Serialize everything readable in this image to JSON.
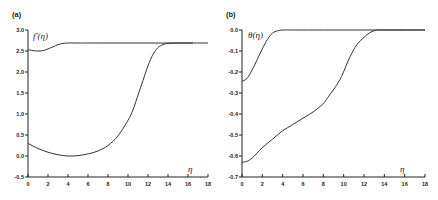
{
  "chart_data": [
    {
      "type": "line",
      "panel_label": "(a)",
      "title": "",
      "xlabel": "η",
      "ylabel": "f′(η)",
      "xlim": [
        0,
        18
      ],
      "ylim": [
        -0.5,
        3.0
      ],
      "xticks": [
        0,
        2,
        4,
        6,
        8,
        10,
        12,
        14,
        16,
        18
      ],
      "xtick_labels": [
        "0",
        "2",
        "4",
        "6",
        "8",
        "10",
        "12",
        "14",
        "16",
        "18"
      ],
      "yticks": [
        3.0,
        2.5,
        2.0,
        1.5,
        1.0,
        0.5,
        0.0,
        -0.5
      ],
      "ytick_labels": [
        "3.0",
        "2.5",
        "2.0",
        "1.5",
        "1.0",
        "0.5",
        "0.0",
        "-0.5"
      ],
      "grid": false,
      "legend": null,
      "series": [
        {
          "name": "upper solution",
          "x": [
            0,
            0.5,
            1,
            1.5,
            2,
            2.5,
            3,
            3.5,
            4,
            5,
            6,
            8,
            10,
            12,
            14,
            16,
            18
          ],
          "y": [
            2.53,
            2.51,
            2.5,
            2.51,
            2.55,
            2.6,
            2.65,
            2.68,
            2.69,
            2.69,
            2.69,
            2.69,
            2.69,
            2.69,
            2.69,
            2.69,
            2.69
          ]
        },
        {
          "name": "lower solution",
          "x": [
            0,
            1,
            2,
            3,
            4,
            5,
            6,
            7,
            8,
            9,
            10,
            10.5,
            11,
            11.5,
            12,
            12.5,
            13,
            13.5,
            14,
            15,
            16,
            16.5
          ],
          "y": [
            0.3,
            0.18,
            0.09,
            0.03,
            0.0,
            0.01,
            0.05,
            0.12,
            0.25,
            0.48,
            0.85,
            1.1,
            1.45,
            1.8,
            2.15,
            2.42,
            2.58,
            2.65,
            2.68,
            2.69,
            2.69,
            2.69
          ]
        }
      ]
    },
    {
      "type": "line",
      "panel_label": "(b)",
      "title": "",
      "xlabel": "η",
      "ylabel": "θ(η)",
      "xlim": [
        0,
        18
      ],
      "ylim": [
        -0.7,
        0.0
      ],
      "xticks": [
        0,
        2,
        4,
        6,
        8,
        10,
        12,
        14,
        16,
        18
      ],
      "xtick_labels": [
        "0",
        "2",
        "4",
        "6",
        "8",
        "10",
        "12",
        "14",
        "16",
        "18"
      ],
      "yticks": [
        0.0,
        -0.1,
        -0.2,
        -0.3,
        -0.4,
        -0.5,
        -0.6,
        -0.7
      ],
      "ytick_labels": [
        "0.0",
        "-0.1",
        "-0.2",
        "-0.3",
        "-0.4",
        "-0.5",
        "-0.6",
        "-0.7"
      ],
      "grid": false,
      "legend": null,
      "series": [
        {
          "name": "upper solution",
          "x": [
            0,
            0.5,
            1,
            1.5,
            2,
            2.5,
            3,
            3.5,
            4,
            5,
            6,
            8,
            10,
            12,
            14,
            16,
            18
          ],
          "y": [
            -0.245,
            -0.23,
            -0.19,
            -0.14,
            -0.09,
            -0.045,
            -0.015,
            -0.004,
            0.0,
            0.0,
            0.0,
            0.0,
            0.0,
            0.0,
            0.0,
            0.0,
            0.0
          ]
        },
        {
          "name": "lower solution",
          "x": [
            0,
            0.5,
            1,
            2,
            3,
            4,
            5,
            6,
            7,
            8,
            8.6,
            9.2,
            9.8,
            10.6,
            11.3,
            12,
            12.6,
            13.3,
            14,
            16,
            18
          ],
          "y": [
            -0.63,
            -0.625,
            -0.61,
            -0.56,
            -0.52,
            -0.48,
            -0.45,
            -0.42,
            -0.39,
            -0.35,
            -0.31,
            -0.27,
            -0.22,
            -0.13,
            -0.07,
            -0.035,
            -0.012,
            0.0,
            0.0,
            0.0,
            0.0
          ]
        }
      ]
    }
  ]
}
